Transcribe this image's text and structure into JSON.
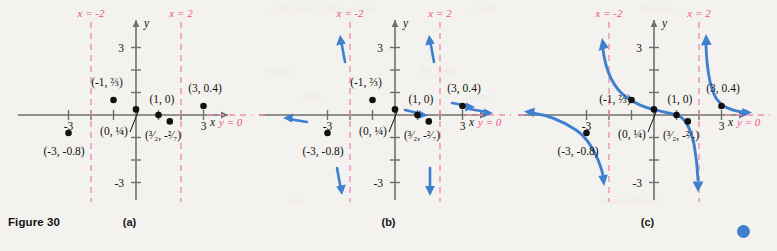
{
  "figure": {
    "label": "Figure 30",
    "panels": [
      {
        "id": "a",
        "caption": "(a)"
      },
      {
        "id": "b",
        "caption": "(b)"
      },
      {
        "id": "c",
        "caption": "(c)"
      }
    ]
  },
  "colors": {
    "curve_blue": "#3f7fd0",
    "asymptote_pink": "#ef4e8e",
    "axis_gray": "#6f6f6f",
    "point_black": "#111111",
    "background": "#f4f2ee"
  },
  "axes": {
    "x_axis_label": "x",
    "y_axis_label": "y",
    "x_ticks": [
      {
        "value": -3,
        "label": "-3"
      },
      {
        "value": 3,
        "label": "3"
      }
    ],
    "y_ticks": [
      {
        "value": 3,
        "label": "3"
      },
      {
        "value": -3,
        "label": "-3"
      }
    ],
    "x_range": [
      -4.2,
      4.2
    ],
    "y_range": [
      -4.2,
      4.2
    ],
    "tick_spacing": 1,
    "grid": false
  },
  "asymptotes": {
    "vertical": [
      {
        "label": "x = -2",
        "value": -2
      },
      {
        "label": "x = 2",
        "value": 2
      }
    ],
    "horizontal": [
      {
        "label": "y = 0",
        "value": 0
      }
    ]
  },
  "points": [
    {
      "label": "(-3, -0.8)",
      "x": -3,
      "y": -0.8,
      "label_dx": -4,
      "label_dy": 22,
      "anchor": "middle",
      "leader": false
    },
    {
      "label": "(-1, ⅔)",
      "x": -1,
      "y": 0.667,
      "label_dx": -6,
      "label_dy": -14,
      "anchor": "middle",
      "leader": false
    },
    {
      "label": "(0, ¼)",
      "x": 0,
      "y": 0.25,
      "label_dx": -22,
      "label_dy": 26,
      "anchor": "middle",
      "leader": true
    },
    {
      "label": "(1, 0)",
      "x": 1,
      "y": 0,
      "label_dx": 4,
      "label_dy": -12,
      "anchor": "middle",
      "leader": false
    },
    {
      "label": "(³⁄₂, -²⁄₇)",
      "x": 1.5,
      "y": -0.286,
      "label_dx": 2,
      "label_dy": 24,
      "anchor": "middle",
      "leader": false
    },
    {
      "label": "(3, 0.4)",
      "x": 3,
      "y": 0.4,
      "label_dx": 2,
      "label_dy": -13,
      "anchor": "middle",
      "leader": false
    }
  ],
  "chart_data": {
    "type": "line",
    "xlabel": "x",
    "ylabel": "y",
    "xlim": [
      -4.2,
      4.2
    ],
    "ylim": [
      -4.2,
      4.2
    ],
    "grid": false,
    "legend": "none",
    "plotted_points": [
      {
        "x": -3,
        "y": -0.8,
        "label": "(-3, -0.8)"
      },
      {
        "x": -1,
        "y": 0.6667,
        "label": "(-1, 2/3)"
      },
      {
        "x": 0,
        "y": 0.25,
        "label": "(0, 1/4)"
      },
      {
        "x": 1,
        "y": 0,
        "label": "(1, 0)"
      },
      {
        "x": 1.5,
        "y": -0.2857,
        "label": "(3/2, -2/7)"
      },
      {
        "x": 3,
        "y": 0.4,
        "label": "(3, 0.4)"
      }
    ],
    "vertical_asymptotes": [
      -2,
      2
    ],
    "horizontal_asymptote": 0,
    "branches": [
      {
        "name": "left",
        "x_domain": [
          -4.2,
          -2
        ],
        "end_behavior": [
          "approaches y=0 from below as x→-∞",
          "approaches -∞ as x→-2⁻"
        ]
      },
      {
        "name": "middle",
        "x_domain": [
          -2,
          2
        ],
        "end_behavior": [
          "approaches +∞ as x→-2⁺",
          "approaches -∞ as x→ 2⁻"
        ]
      },
      {
        "name": "right",
        "x_domain": [
          2,
          4.2
        ],
        "end_behavior": [
          "approaches +∞ as x→ 2⁺",
          "approaches y=0 from above as x→+∞"
        ]
      }
    ],
    "panels": [
      {
        "id": "a",
        "caption": "(a)",
        "shows": "plotted points and asymptotes only"
      },
      {
        "id": "b",
        "caption": "(b)",
        "shows": "points, asymptotes, and blue direction arrows indicating end behavior"
      },
      {
        "id": "c",
        "caption": "(c)",
        "shows": "complete blue graph of the three branches"
      }
    ]
  },
  "ghost_text": [
    {
      "text": "in the graph of R(x) and so",
      "x": 268,
      "y": 4
    },
    {
      "text": "it must",
      "x": 470,
      "y": 4
    },
    {
      "text": "behavior",
      "x": 640,
      "y": 4
    },
    {
      "text": "crosses",
      "x": 262,
      "y": 66
    },
    {
      "text": "the graph",
      "x": 420,
      "y": 66
    },
    {
      "text": "of the",
      "x": 300,
      "y": 92
    },
    {
      "text": "points",
      "x": 470,
      "y": 92
    },
    {
      "text": "asymptote and",
      "x": 600,
      "y": 196
    },
    {
      "text": "see",
      "x": 290,
      "y": 196
    }
  ]
}
